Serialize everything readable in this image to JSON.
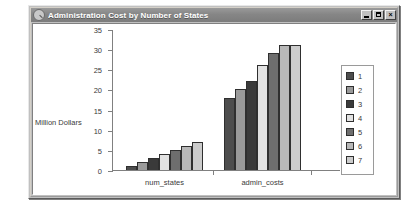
{
  "window": {
    "title": "Administration Cost by Number of States",
    "icon": "app-magnifier-icon",
    "buttons": {
      "minimize": "_",
      "maximize": "□",
      "close": "×"
    }
  },
  "chart_data": {
    "type": "bar",
    "title": "Administration Cost by Number of States",
    "xlabel": "",
    "ylabel": "Million Dollars",
    "categories": [
      "num_states",
      "admin_costs"
    ],
    "ylim": [
      0,
      35
    ],
    "yticks": [
      0,
      5,
      10,
      15,
      20,
      25,
      30,
      35
    ],
    "grid": false,
    "legend_position": "right",
    "series": [
      {
        "name": "1",
        "color": "#4d4d4d",
        "values": [
          1,
          18
        ]
      },
      {
        "name": "2",
        "color": "#9a9a9a",
        "values": [
          2,
          20
        ]
      },
      {
        "name": "3",
        "color": "#3a3a3a",
        "values": [
          3,
          22
        ]
      },
      {
        "name": "4",
        "color": "#e2e2e2",
        "values": [
          4,
          26
        ]
      },
      {
        "name": "5",
        "color": "#6e6e6e",
        "values": [
          5,
          29
        ]
      },
      {
        "name": "6",
        "color": "#b8b8b8",
        "values": [
          6,
          31
        ]
      },
      {
        "name": "7",
        "color": "#cccccc",
        "values": [
          7,
          31
        ]
      }
    ]
  }
}
